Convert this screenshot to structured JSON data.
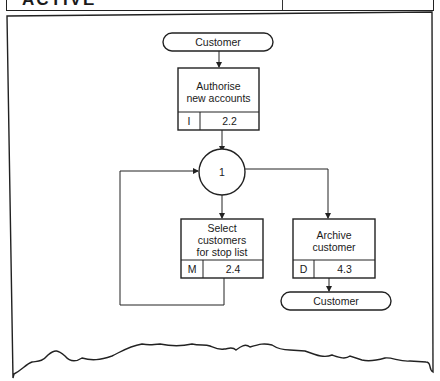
{
  "header": {
    "partial_title": "ACTIVE"
  },
  "diagram": {
    "terminals": [
      {
        "id": "customer-top",
        "label": "Customer"
      },
      {
        "id": "customer-bottom",
        "label": "Customer"
      }
    ],
    "processes": [
      {
        "id": "authorise",
        "title_line1": "Authorise",
        "title_line2": "new accounts",
        "type": "I",
        "number": "2.2"
      },
      {
        "id": "select",
        "title_line1": "Select",
        "title_line2": "customers",
        "title_line3": "for stop list",
        "type": "M",
        "number": "2.4"
      },
      {
        "id": "archive",
        "title_line1": "Archive",
        "title_line2": "customer",
        "type": "D",
        "number": "4.3"
      }
    ],
    "state": {
      "label": "1"
    }
  }
}
